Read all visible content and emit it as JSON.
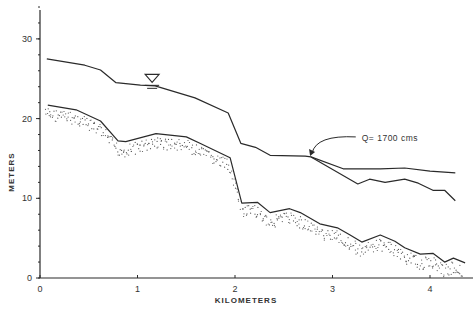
{
  "chart_data": {
    "type": "line",
    "title": "",
    "xlabel": "KILOMETERS",
    "ylabel": "METERS",
    "xlim": [
      0,
      4.4
    ],
    "ylim": [
      0,
      34
    ],
    "x_ticks": [
      0,
      1,
      2,
      3,
      4
    ],
    "x_tick_labels": [
      "0",
      "1",
      "2",
      "3",
      "4"
    ],
    "y_ticks": [
      0,
      10,
      20,
      30
    ],
    "y_tick_labels": [
      "0",
      "10",
      "20",
      "30"
    ],
    "y_minor_step": 2,
    "grid": false,
    "legend": "none",
    "series": [
      {
        "name": "Water surface",
        "style": "solid",
        "points": [
          [
            0.07,
            27.5
          ],
          [
            0.46,
            26.7
          ],
          [
            0.62,
            26.1
          ],
          [
            0.78,
            24.5
          ],
          [
            1.03,
            24.2
          ],
          [
            1.18,
            24.1
          ],
          [
            1.59,
            22.6
          ],
          [
            1.93,
            20.7
          ],
          [
            2.06,
            16.9
          ],
          [
            2.21,
            16.4
          ],
          [
            2.36,
            15.4
          ],
          [
            2.72,
            15.3
          ],
          [
            2.78,
            15.2
          ]
        ]
      },
      {
        "name": "Water surface (upper branch)",
        "style": "solid",
        "points": [
          [
            2.78,
            15.2
          ],
          [
            3.11,
            13.7
          ],
          [
            3.49,
            13.7
          ],
          [
            3.74,
            13.8
          ],
          [
            4.0,
            13.4
          ],
          [
            4.26,
            13.2
          ]
        ]
      },
      {
        "name": "Water surface (lower branch)",
        "style": "solid",
        "points": [
          [
            2.78,
            15.2
          ],
          [
            3.26,
            11.8
          ],
          [
            3.38,
            12.4
          ],
          [
            3.54,
            12.0
          ],
          [
            3.74,
            12.4
          ],
          [
            3.88,
            11.9
          ],
          [
            4.03,
            11.0
          ],
          [
            4.15,
            11.0
          ],
          [
            4.26,
            9.7
          ]
        ]
      },
      {
        "name": "Channel bed",
        "style": "solid",
        "points": [
          [
            0.08,
            21.7
          ],
          [
            0.37,
            21.1
          ],
          [
            0.62,
            19.7
          ],
          [
            0.8,
            17.2
          ],
          [
            0.88,
            17.1
          ],
          [
            1.19,
            18.1
          ],
          [
            1.5,
            17.7
          ],
          [
            1.64,
            16.9
          ],
          [
            1.95,
            15.1
          ],
          [
            2.07,
            9.4
          ],
          [
            2.23,
            9.5
          ],
          [
            2.36,
            8.2
          ],
          [
            2.56,
            8.7
          ],
          [
            2.67,
            8.2
          ],
          [
            2.87,
            6.8
          ],
          [
            3.05,
            6.3
          ],
          [
            3.18,
            5.4
          ],
          [
            3.3,
            4.5
          ],
          [
            3.49,
            5.4
          ],
          [
            3.64,
            4.6
          ],
          [
            3.74,
            3.8
          ],
          [
            3.9,
            3.0
          ],
          [
            4.03,
            3.1
          ],
          [
            4.15,
            2.0
          ],
          [
            4.24,
            2.5
          ],
          [
            4.36,
            1.9
          ]
        ]
      },
      {
        "name": "Bed deposit (stippled)",
        "style": "dotted-band",
        "depth_m": 1.6
      }
    ],
    "annotations": [
      {
        "text": "Q= 1700 cms",
        "x": 3.3,
        "y": 17.2,
        "arrow_to": [
          2.77,
          15.3
        ]
      },
      {
        "text": "",
        "symbol": "water-level-triangle",
        "x": 1.15,
        "y": 24.3
      }
    ]
  }
}
